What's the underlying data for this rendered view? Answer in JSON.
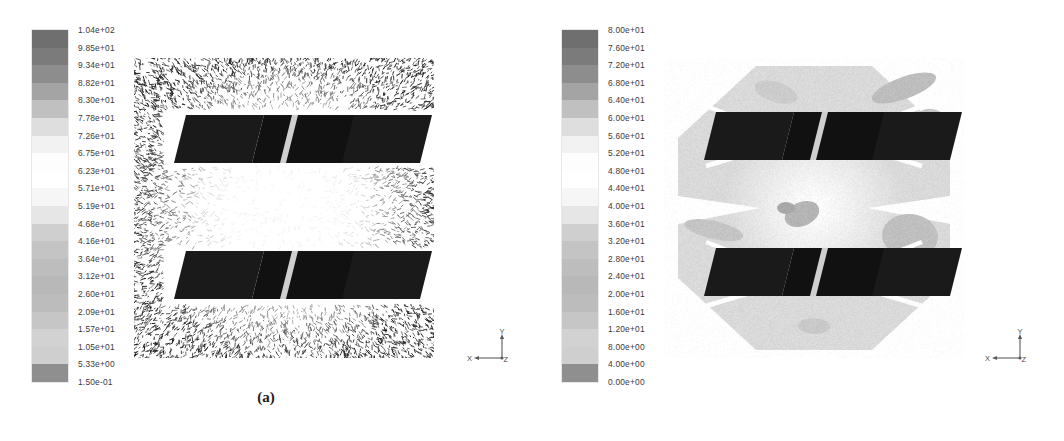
{
  "figure": {
    "title": "",
    "panels": [
      {
        "id": "a",
        "caption": "(a)",
        "plot_type": "velocity-vector-field",
        "colorbar": {
          "unit_hint": "",
          "max": 104,
          "min": 0.15,
          "ticks": [
            "1.04e+02",
            "9.85e+01",
            "9.34e+01",
            "8.82e+01",
            "8.30e+01",
            "7.78e+01",
            "7.26e+01",
            "6.75e+01",
            "6.23e+01",
            "5.71e+01",
            "5.19e+01",
            "4.68e+01",
            "4.16e+01",
            "3.64e+01",
            "3.12e+01",
            "2.60e+01",
            "2.09e+01",
            "1.57e+01",
            "1.05e+01",
            "5.33e+00",
            "1.50e-01"
          ],
          "values": [
            104.0,
            98.5,
            93.4,
            88.2,
            83.0,
            77.8,
            72.6,
            67.5,
            62.3,
            57.1,
            51.9,
            46.8,
            41.6,
            36.4,
            31.2,
            26.0,
            20.9,
            15.7,
            10.5,
            5.33,
            0.15
          ]
        },
        "axis_triad": {
          "x_label": "X",
          "y_label": "Y",
          "z_label": "Z"
        }
      },
      {
        "id": "b",
        "caption": "(b)",
        "plot_type": "contour-field",
        "colorbar": {
          "unit_hint": "",
          "max": 80,
          "min": 0,
          "ticks": [
            "8.00e+01",
            "7.60e+01",
            "7.20e+01",
            "6.80e+01",
            "6.40e+01",
            "6.00e+01",
            "5.60e+01",
            "5.20e+01",
            "4.80e+01",
            "4.40e+01",
            "4.00e+01",
            "3.60e+01",
            "3.20e+01",
            "2.80e+01",
            "2.40e+01",
            "2.00e+01",
            "1.60e+01",
            "1.20e+01",
            "8.00e+00",
            "4.00e+00",
            "0.00e+00"
          ],
          "values": [
            80,
            76,
            72,
            68,
            64,
            60,
            56,
            52,
            48,
            44,
            40,
            36,
            32,
            28,
            24,
            20,
            16,
            12,
            8,
            4,
            0
          ]
        },
        "axis_triad": {
          "x_label": "X",
          "y_label": "Y",
          "z_label": "Z"
        }
      }
    ]
  },
  "colors": {
    "page_background": "#ffffff",
    "text": "#3a3a3a",
    "caption": "#1b1b1b",
    "colorbar_stops": [
      "#6f6f6f",
      "#7b7b7b",
      "#8d8d8d",
      "#a4a4a4",
      "#c0c0c0",
      "#dedede",
      "#f2f2f2",
      "#fdfdfd",
      "#ffffff",
      "#f6f6f6",
      "#e6e6e6",
      "#cfcfcf",
      "#c4c4c4",
      "#bdbdbd",
      "#b8b8b8",
      "#bcbcbc",
      "#c6c6c6",
      "#d2d2d2",
      "#cfcfcf",
      "#8f8f8f",
      "#6b6b6b"
    ],
    "blade_dark": "#1a1a1a",
    "field_light": "#d9d9d9"
  }
}
